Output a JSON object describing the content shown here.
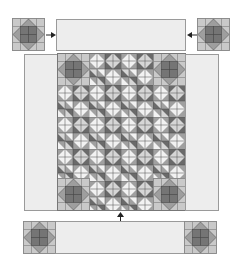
{
  "diagram": {
    "title": "",
    "colors": {
      "background": "#ffffff",
      "border_fabric": "#ededed",
      "border_outline": "#9a9a9a",
      "light": "#d9d9d9",
      "mid": "#a8a8a8",
      "dark": "#6e6e6e",
      "darker": "#555555",
      "white_tri": "#f4f4f4",
      "arrow": "#222222"
    },
    "parts": {
      "top_left_block": "corner-block",
      "top_strip": "border-strip",
      "top_right_block": "corner-block",
      "left_side_border": "side-border",
      "center_quilt": "quilt-center",
      "right_side_border": "side-border",
      "bottom_strip": "border-strip-with-corners"
    },
    "arrows": [
      {
        "name": "arrow-right",
        "direction": "right"
      },
      {
        "name": "arrow-left",
        "direction": "left"
      },
      {
        "name": "arrow-up",
        "direction": "up"
      }
    ]
  }
}
